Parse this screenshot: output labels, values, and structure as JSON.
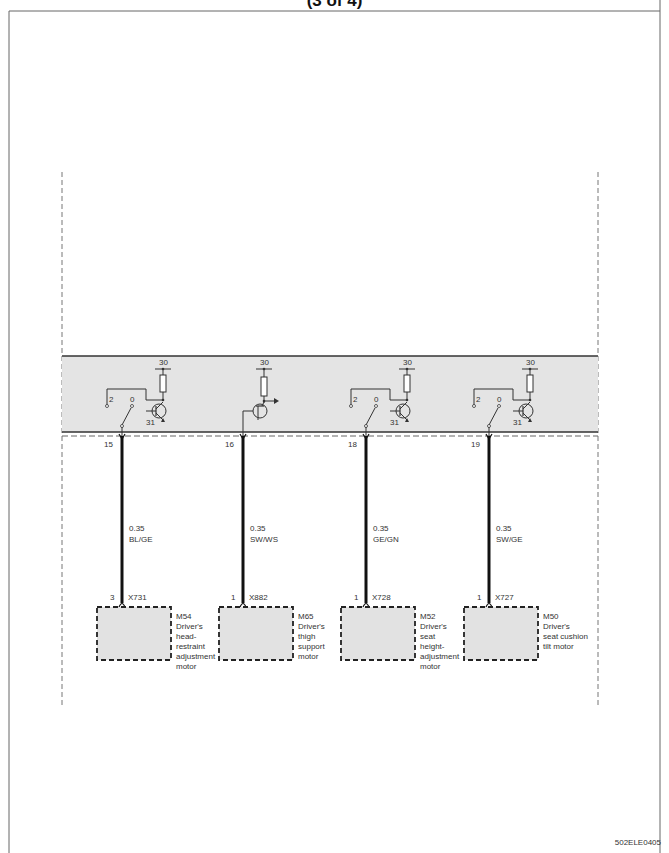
{
  "page": {
    "title": "(3 of 4)",
    "drawing_code": "502ELE0405"
  },
  "module": {
    "outputs": [
      {
        "pin": "15",
        "symbol": "switch-transistor",
        "supply": "30",
        "ground": "31",
        "switch_positions": [
          "2",
          "0"
        ],
        "wire_gauge": "0.35",
        "wire_color": "BL/GE",
        "connector_pin": "3",
        "connector": "X731",
        "component_id": "M54",
        "component_desc": [
          "Driver's",
          "head-",
          "restraint",
          "adjustment",
          "motor"
        ]
      },
      {
        "pin": "16",
        "symbol": "transistor-output",
        "supply": "30",
        "ground": "",
        "switch_positions": [],
        "wire_gauge": "0.35",
        "wire_color": "SW/WS",
        "connector_pin": "1",
        "connector": "X882",
        "component_id": "M65",
        "component_desc": [
          "Driver's",
          "thigh",
          "support",
          "motor"
        ]
      },
      {
        "pin": "18",
        "symbol": "switch-transistor",
        "supply": "30",
        "ground": "31",
        "switch_positions": [
          "2",
          "0"
        ],
        "wire_gauge": "0.35",
        "wire_color": "GE/GN",
        "connector_pin": "1",
        "connector": "X728",
        "component_id": "M52",
        "component_desc": [
          "Driver's",
          "seat",
          "height-",
          "adjustment",
          "motor"
        ]
      },
      {
        "pin": "19",
        "symbol": "switch-transistor",
        "supply": "30",
        "ground": "31",
        "switch_positions": [
          "2",
          "0"
        ],
        "wire_gauge": "0.35",
        "wire_color": "SW/GE",
        "connector_pin": "1",
        "connector": "X727",
        "component_id": "M50",
        "component_desc": [
          "Driver's",
          "seat cushion",
          "tilt motor"
        ]
      }
    ]
  },
  "colors": {
    "module_fill": "#e4e4e4",
    "component_fill": "#e2e2e2",
    "wire": "#111111",
    "line": "#444444"
  }
}
